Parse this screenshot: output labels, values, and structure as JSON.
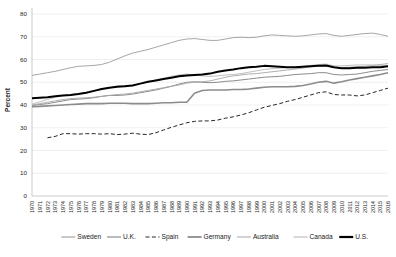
{
  "chart_data": {
    "type": "line",
    "title": "",
    "xlabel": "",
    "ylabel": "Percent",
    "ylim": [
      0,
      80
    ],
    "ytick_step": 10,
    "yticks": [
      0,
      10,
      20,
      30,
      40,
      50,
      60,
      70,
      80
    ],
    "grid": true,
    "legend_position": "bottom",
    "x": [
      1970,
      1971,
      1972,
      1973,
      1974,
      1975,
      1976,
      1977,
      1978,
      1979,
      1980,
      1981,
      1982,
      1983,
      1984,
      1985,
      1986,
      1987,
      1988,
      1989,
      1990,
      1991,
      1992,
      1993,
      1994,
      1995,
      1996,
      1997,
      1998,
      1999,
      2000,
      2001,
      2002,
      2003,
      2004,
      2005,
      2006,
      2007,
      2008,
      2009,
      2010,
      2011,
      2012,
      2013,
      2014,
      2015,
      2016
    ],
    "xtick_labels": [
      "1970",
      "1971",
      "1972",
      "1973",
      "1974",
      "1975",
      "1976",
      "1977",
      "1978",
      "1979",
      "1980",
      "1981",
      "1982",
      "1983",
      "1984",
      "1985",
      "1986",
      "1987",
      "1988",
      "1989",
      "1990",
      "1991",
      "1992",
      "1993",
      "1994",
      "1995",
      "1996",
      "1997",
      "1998",
      "1999",
      "2000",
      "2001",
      "2002",
      "2003",
      "2004",
      "2005",
      "2006",
      "2007",
      "2008",
      "2009",
      "2010",
      "2011",
      "2012",
      "2013",
      "2014",
      "2015",
      "2016"
    ],
    "series": [
      {
        "name": "Sweden",
        "color": "#a6a6a6",
        "style": "solid",
        "width": 1.0,
        "values": [
          53.0,
          53.6,
          54.2,
          54.8,
          55.6,
          56.4,
          57.0,
          57.2,
          57.4,
          57.8,
          58.8,
          60.2,
          61.6,
          62.8,
          63.6,
          64.4,
          65.4,
          66.4,
          67.4,
          68.4,
          69.0,
          69.2,
          68.8,
          68.4,
          68.4,
          69.0,
          69.6,
          69.8,
          69.6,
          69.8,
          70.4,
          70.8,
          70.6,
          70.4,
          70.2,
          70.4,
          70.8,
          71.2,
          71.4,
          70.6,
          70.2,
          70.6,
          71.0,
          71.4,
          71.6,
          71.0,
          70.2
        ]
      },
      {
        "name": "U.K.",
        "color": "#8c8c8c",
        "style": "solid",
        "width": 1.0,
        "values": [
          39.8,
          40.2,
          40.6,
          41.2,
          41.8,
          42.4,
          42.6,
          42.8,
          43.2,
          43.8,
          44.2,
          44.2,
          44.4,
          44.8,
          45.4,
          46.0,
          46.6,
          47.4,
          48.2,
          49.2,
          50.0,
          50.2,
          50.0,
          49.8,
          50.0,
          50.4,
          50.6,
          51.0,
          51.4,
          51.8,
          52.2,
          52.4,
          52.6,
          53.0,
          53.4,
          53.6,
          53.8,
          54.2,
          54.2,
          53.4,
          53.2,
          53.4,
          53.6,
          54.2,
          54.8,
          55.2,
          55.6
        ]
      },
      {
        "name": "Spain",
        "color": "#262626",
        "style": "dashed",
        "width": 1.0,
        "values": [
          null,
          null,
          25.6,
          26.2,
          27.4,
          27.4,
          27.2,
          27.4,
          27.4,
          27.2,
          27.4,
          27.0,
          27.2,
          27.6,
          27.2,
          27.0,
          27.8,
          29.0,
          30.2,
          31.2,
          32.2,
          32.8,
          33.0,
          33.0,
          33.4,
          34.2,
          34.8,
          35.6,
          36.6,
          37.8,
          39.0,
          39.8,
          40.6,
          41.6,
          42.4,
          43.4,
          44.4,
          45.4,
          45.8,
          44.6,
          44.4,
          44.4,
          44.0,
          44.4,
          45.4,
          46.4,
          47.4
        ]
      },
      {
        "name": "Germany",
        "color": "#8c8c8c",
        "style": "solid",
        "width": 1.6,
        "values": [
          39.2,
          39.4,
          39.6,
          39.8,
          40.0,
          40.2,
          40.4,
          40.6,
          40.6,
          40.6,
          40.8,
          40.8,
          40.8,
          40.6,
          40.6,
          40.6,
          40.8,
          41.0,
          41.0,
          41.2,
          41.2,
          45.2,
          46.4,
          46.6,
          46.6,
          46.6,
          46.8,
          46.8,
          47.0,
          47.4,
          47.8,
          48.0,
          48.0,
          48.0,
          48.2,
          48.6,
          49.2,
          50.0,
          50.4,
          49.6,
          50.2,
          51.0,
          51.6,
          52.2,
          52.8,
          53.4,
          54.2
        ]
      },
      {
        "name": "Australia",
        "color": "#a6a6a6",
        "style": "solid",
        "width": 0.9,
        "values": [
          40.0,
          40.6,
          41.2,
          41.8,
          42.4,
          42.8,
          43.0,
          43.2,
          43.4,
          43.8,
          44.2,
          44.6,
          44.8,
          45.2,
          45.8,
          46.4,
          47.0,
          47.6,
          48.2,
          48.8,
          49.6,
          50.0,
          50.2,
          50.6,
          51.4,
          52.2,
          52.8,
          53.2,
          53.6,
          53.8,
          54.2,
          54.6,
          55.0,
          55.4,
          55.8,
          56.2,
          56.8,
          57.2,
          57.2,
          56.6,
          56.4,
          56.6,
          56.8,
          57.0,
          57.4,
          57.8,
          58.2
        ]
      },
      {
        "name": "Canada",
        "color": "#bfbfbf",
        "style": "solid",
        "width": 1.0,
        "values": [
          40.4,
          41.4,
          42.4,
          43.4,
          44.2,
          44.6,
          45.0,
          45.4,
          46.0,
          46.8,
          47.6,
          48.4,
          48.6,
          48.8,
          49.4,
          50.2,
          51.0,
          51.8,
          52.6,
          53.2,
          53.6,
          53.2,
          52.8,
          52.6,
          52.8,
          53.2,
          53.4,
          53.8,
          54.4,
          55.0,
          55.6,
          56.0,
          56.2,
          56.4,
          56.8,
          57.0,
          57.4,
          57.8,
          58.0,
          57.2,
          57.2,
          57.4,
          57.6,
          57.6,
          57.6,
          57.4,
          57.2
        ]
      },
      {
        "name": "U.S.",
        "color": "#000000",
        "style": "solid",
        "width": 2.0,
        "values": [
          43.0,
          43.2,
          43.4,
          43.8,
          44.2,
          44.4,
          44.8,
          45.4,
          46.2,
          47.0,
          47.6,
          48.0,
          48.2,
          48.6,
          49.4,
          50.2,
          50.8,
          51.4,
          52.0,
          52.6,
          53.0,
          53.2,
          53.4,
          53.8,
          54.6,
          55.2,
          55.6,
          56.2,
          56.6,
          56.8,
          57.2,
          57.0,
          56.8,
          56.6,
          56.6,
          56.8,
          57.0,
          57.2,
          57.4,
          56.6,
          56.2,
          56.2,
          56.4,
          56.4,
          56.6,
          56.6,
          57.0
        ]
      }
    ],
    "legend": [
      {
        "label": "Sweden",
        "color": "#a6a6a6",
        "style": "solid",
        "width": 1.2
      },
      {
        "label": "U.K.",
        "color": "#8c8c8c",
        "style": "solid",
        "width": 1.2
      },
      {
        "label": "Spain",
        "color": "#262626",
        "style": "dashed",
        "width": 1.2
      },
      {
        "label": "Germany",
        "color": "#8c8c8c",
        "style": "solid",
        "width": 1.8
      },
      {
        "label": "Australia",
        "color": "#a6a6a6",
        "style": "solid",
        "width": 1.0
      },
      {
        "label": "Canada",
        "color": "#bfbfbf",
        "style": "solid",
        "width": 1.2
      },
      {
        "label": "U.S.",
        "color": "#000000",
        "style": "solid",
        "width": 2.2
      }
    ]
  }
}
